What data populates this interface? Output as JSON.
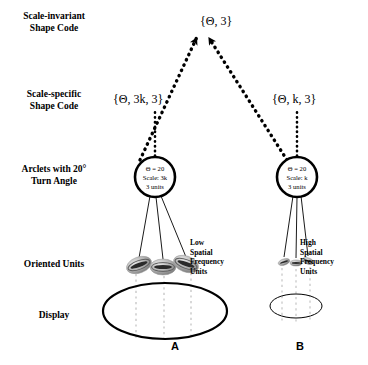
{
  "figure": {
    "background_color": "#ffffff",
    "stroke_color": "#000000",
    "dotted_display_color": "#c8c8c8"
  },
  "row_labels": [
    {
      "id": "scale-invariant",
      "line1": "Scale-invariant",
      "line2": "Shape Code",
      "top": 10
    },
    {
      "id": "scale-specific",
      "line1": "Scale-specific",
      "line2": "Shape Code",
      "top": 88
    },
    {
      "id": "arclets",
      "line1": "Arclets with 20°",
      "line2": "Turn Angle",
      "top": 163
    },
    {
      "id": "oriented-units",
      "line1": "Oriented Units",
      "line2": "",
      "top": 258
    },
    {
      "id": "display",
      "line1": "Display",
      "line2": "",
      "top": 309
    }
  ],
  "codes": {
    "invariant": {
      "text": "{Θ, 3}",
      "x": 200,
      "y": 14
    },
    "left_specific": {
      "text": "{Θ, 3k, 3}",
      "x": 113,
      "y": 92
    },
    "right_specific": {
      "text": "{Θ, k, 3}",
      "x": 272,
      "y": 92
    }
  },
  "arclets": {
    "left": {
      "theta": "Θ = 20",
      "scale": "Scale: 3k",
      "units": "3 units",
      "cx": 155,
      "cy": 177,
      "r": 20
    },
    "right": {
      "theta": "Θ = 20",
      "scale": "Scale: k",
      "units": "3 units",
      "cx": 297,
      "cy": 177,
      "r": 20
    }
  },
  "frequency_labels": {
    "low": {
      "lines": [
        "Low",
        "Spatial",
        "Frequency",
        "Units"
      ],
      "left": 190,
      "top": 238
    },
    "high": {
      "lines": [
        "High",
        "Spatial",
        "Frequency",
        "Units"
      ],
      "left": 300,
      "top": 238
    }
  },
  "panels": [
    {
      "letter": "A",
      "left": 165,
      "top": 340
    },
    {
      "letter": "B",
      "left": 290,
      "top": 340
    }
  ],
  "oriented_units": {
    "left_panel": [
      {
        "cx": 139,
        "cy": 265,
        "rx": 13,
        "ry": 8,
        "rot": -20
      },
      {
        "cx": 163,
        "cy": 267,
        "rx": 13,
        "ry": 8,
        "rot": 0
      },
      {
        "cx": 186,
        "cy": 264,
        "rx": 13,
        "ry": 8,
        "rot": 20
      }
    ],
    "right_panel": [
      {
        "cx": 284,
        "cy": 262,
        "rx": 6,
        "ry": 3,
        "rot": -18
      },
      {
        "cx": 296,
        "cy": 263,
        "rx": 6,
        "ry": 3,
        "rot": 0
      },
      {
        "cx": 308,
        "cy": 261,
        "rx": 6,
        "ry": 3,
        "rot": 18
      }
    ]
  },
  "displays": [
    {
      "id": "display-a",
      "cx": 165,
      "cy": 311,
      "rx": 62,
      "ry": 28,
      "stroke_width": 2.2
    },
    {
      "id": "display-b",
      "cx": 296,
      "cy": 306,
      "rx": 26,
      "ry": 12,
      "stroke_width": 1
    }
  ]
}
